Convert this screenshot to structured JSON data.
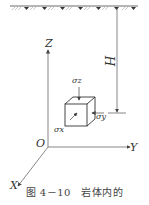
{
  "labels": {
    "z_axis": "Z",
    "y_axis": "Y",
    "x_axis": "X",
    "origin": "O",
    "depth": "H",
    "sigma_z": "σz",
    "sigma_y": "σy",
    "sigma_x": "σx"
  },
  "caption": "图 4－10　岩体内的",
  "colors": {
    "line": "#555555",
    "hatch": "#aaaaaa",
    "text": "#333333"
  }
}
